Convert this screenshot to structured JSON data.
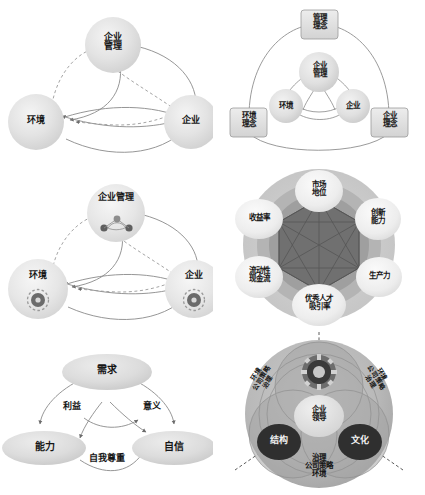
{
  "page": {
    "background": "#ffffff",
    "layout": "2 columns x 3 rows of conceptual diagrams"
  },
  "palette": {
    "node_fill_light": "#e2e2e2",
    "node_fill_mid": "#cfcfcf",
    "node_fill_dark": "#3f3f3f",
    "ring_outer": "#d4d4d4",
    "ring_mid": "#b5b5b5",
    "hex_core": "#6e6e6e",
    "edge": "#7a7a7a",
    "text_dark": "#161616",
    "text_light": "#f2f2f2"
  },
  "diagrams": [
    {
      "id": "d1",
      "name": "three-sphere-management-model",
      "type": "node-edge",
      "nodes": [
        {
          "key": "management",
          "label_lines": [
            "企业",
            "管理"
          ],
          "pos": "top"
        },
        {
          "key": "environment",
          "label_lines": [
            "环境"
          ],
          "pos": "left"
        },
        {
          "key": "enterprise",
          "label_lines": [
            "企业"
          ],
          "pos": "right"
        }
      ],
      "edges": [
        {
          "from": "environment",
          "to": "management",
          "style": "dashed"
        },
        {
          "from": "management",
          "to": "enterprise",
          "style": "solid"
        },
        {
          "from": "environment",
          "to": "enterprise",
          "style": "solid"
        },
        {
          "from": "enterprise",
          "to": "management",
          "style": "dashed"
        },
        {
          "from": "management",
          "to": "environment",
          "style": "solid"
        },
        {
          "from": "enterprise",
          "to": "environment",
          "style": "solid"
        }
      ]
    },
    {
      "id": "d2",
      "name": "concept-layer-management-model",
      "type": "nested-node-edge",
      "inner_nodes": [
        {
          "key": "management",
          "label_lines": [
            "企业",
            "管理"
          ]
        },
        {
          "key": "environment",
          "label_lines": [
            "环境"
          ]
        },
        {
          "key": "enterprise",
          "label_lines": [
            "企业"
          ]
        }
      ],
      "outer_nodes": [
        {
          "key": "management_concept",
          "label_lines": [
            "管理",
            "理念"
          ]
        },
        {
          "key": "environment_concept",
          "label_lines": [
            "环境",
            "理念"
          ]
        },
        {
          "key": "enterprise_concept",
          "label_lines": [
            "企业",
            "理念"
          ]
        }
      ]
    },
    {
      "id": "d3",
      "name": "three-sphere-with-icons",
      "type": "node-edge-icon",
      "nodes": [
        {
          "key": "management",
          "label_lines": [
            "企业管理"
          ],
          "icon": "network-icon",
          "pos": "top"
        },
        {
          "key": "environment",
          "label_lines": [
            "环境"
          ],
          "icon": "gear-icon",
          "pos": "left"
        },
        {
          "key": "enterprise",
          "label_lines": [
            "企业"
          ],
          "icon": "gear-icon",
          "pos": "right"
        }
      ]
    },
    {
      "id": "d4",
      "name": "six-factor-performance-wheel",
      "type": "radial-hexagon",
      "center_shape": "hexagon-complete-graph",
      "segments": [
        {
          "label_lines": [
            "市场",
            "地位"
          ],
          "angle_deg": 270
        },
        {
          "label_lines": [
            "创新",
            "能力"
          ],
          "angle_deg": 330
        },
        {
          "label_lines": [
            "生产力"
          ],
          "angle_deg": 30
        },
        {
          "label_lines": [
            "优秀人才",
            "吸引率"
          ],
          "angle_deg": 90
        },
        {
          "label_lines": [
            "流动性",
            "现金流"
          ],
          "angle_deg": 150
        },
        {
          "label_lines": [
            "收益率"
          ],
          "angle_deg": 210
        }
      ]
    },
    {
      "id": "d5",
      "name": "needs-ability-confidence-triangle",
      "type": "node-edge-labeled",
      "nodes": [
        {
          "key": "need",
          "label_lines": [
            "需求"
          ],
          "pos": "top"
        },
        {
          "key": "ability",
          "label_lines": [
            "能力"
          ],
          "pos": "bottom-left"
        },
        {
          "key": "confidence",
          "label_lines": [
            "自信"
          ],
          "pos": "bottom-right"
        }
      ],
      "edge_labels": [
        {
          "text": "利益",
          "between": "need-ability"
        },
        {
          "text": "意义",
          "between": "need-confidence"
        },
        {
          "text": "自我尊重",
          "between": "ability-confidence"
        }
      ]
    },
    {
      "id": "d6",
      "name": "corporate-leadership-sphere",
      "type": "layered-circle",
      "core_nodes": [
        {
          "key": "leadership",
          "label_lines": [
            "企业",
            "领导"
          ],
          "tone": "light"
        },
        {
          "key": "structure",
          "label_lines": [
            "结构"
          ],
          "tone": "dark"
        },
        {
          "key": "culture",
          "label_lines": [
            "文化"
          ],
          "tone": "dark"
        }
      ],
      "top_icon": "gear-icon",
      "outer_labels": [
        {
          "key": "left",
          "label_lines": [
            "环境",
            "公司策略",
            "治理"
          ],
          "rotation_deg": -57
        },
        {
          "key": "right",
          "label_lines": [
            "环境",
            "公司策略",
            "治理"
          ],
          "rotation_deg": 57
        },
        {
          "key": "bottom",
          "label_lines": [
            "治理",
            "公司策略",
            "环境"
          ],
          "rotation_deg": 0
        }
      ]
    }
  ]
}
